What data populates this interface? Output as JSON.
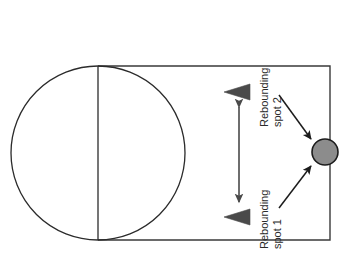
{
  "diagram": {
    "colors": {
      "court_stroke": "#3a3a3a",
      "circle_stroke": "#2b2b2b",
      "ball_fill": "#8c8c8c",
      "ball_stroke": "#1c1c1c",
      "marker_fill": "#4a4a4a",
      "arrow_stroke": "#1c1c1c",
      "background": "#ffffff"
    },
    "court": {
      "name": "court-rectangle",
      "x": 98,
      "y": 66,
      "width": 232,
      "height": 174
    },
    "center_circle": {
      "name": "center-circle",
      "cx": 98,
      "cy": 153,
      "r": 87
    },
    "divider": {
      "name": "halfcourt-line",
      "x": 98,
      "y1": 66,
      "y2": 240
    },
    "ball": {
      "name": "ball",
      "cx": 325,
      "cy": 152,
      "r": 13,
      "label": "ball"
    },
    "markers": [
      {
        "name": "spot-2-triangle",
        "label": "Rebounding spot 2 marker",
        "x": 238,
        "y": 92,
        "direction": "left"
      },
      {
        "name": "spot-1-triangle",
        "label": "Rebounding spot 1 marker",
        "x": 238,
        "y": 217,
        "direction": "left"
      }
    ],
    "span_arrow": {
      "name": "spot-separation-arrow",
      "label": "distance between rebounding spots",
      "x": 239,
      "y_top": 104,
      "y_bottom": 205,
      "heads": "both"
    },
    "labels": {
      "spot2": {
        "name": "rebounding-spot-2-label",
        "line1": "Rebounding",
        "line2": "spot 2",
        "rotation_deg": -90
      },
      "spot1": {
        "name": "rebounding-spot-1-label",
        "line1": "Rebounding",
        "line2": "spot 1",
        "rotation_deg": -90
      }
    },
    "lead_arrows": [
      {
        "name": "spot-2-to-ball-arrow",
        "label": "arrow from Rebounding spot 2 to ball",
        "x1": 279,
        "y1": 95,
        "x2": 312,
        "y2": 141
      },
      {
        "name": "spot-1-to-ball-arrow",
        "label": "arrow from Rebounding spot 1 to ball",
        "x1": 279,
        "y1": 208,
        "x2": 312,
        "y2": 165
      }
    ]
  }
}
